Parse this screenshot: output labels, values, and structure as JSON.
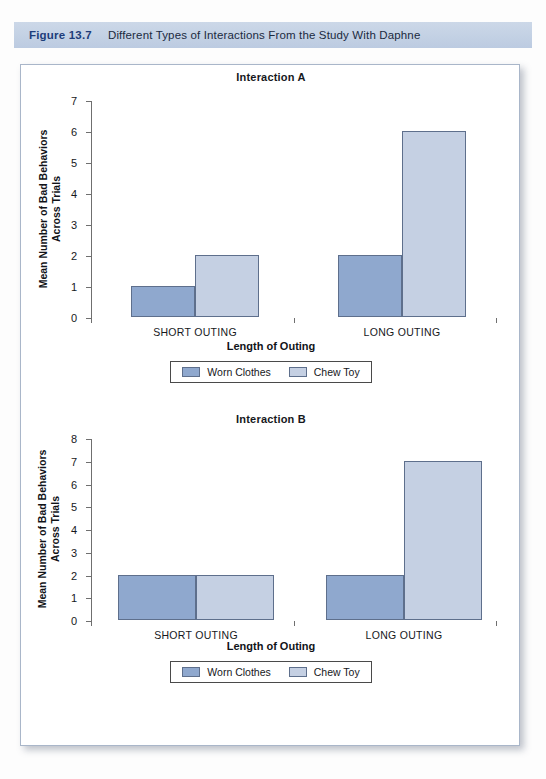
{
  "figure": {
    "number": "Figure 13.7",
    "title": "Different Types of Interactions From the Study With Daphne",
    "bar_color": "#c3d1e4",
    "number_color": "#1d3d7a"
  },
  "series_colors": {
    "worn_clothes": "#8fa8ce",
    "chew_toy": "#c5d0e3"
  },
  "legend": {
    "worn_clothes_label": "Worn Clothes",
    "chew_toy_label": "Chew Toy"
  },
  "chart_data": [
    {
      "id": "interaction-a",
      "type": "bar",
      "title": "Interaction A",
      "xlabel": "Length of Outing",
      "ylabel": "Mean Number of Bad Behaviors Across Trials",
      "ylabel_line1": "Mean Number of Bad Behaviors",
      "ylabel_line2": "Across Trials",
      "categories": [
        "SHORT OUTING",
        "LONG OUTING"
      ],
      "yticks": [
        0,
        1,
        2,
        3,
        4,
        5,
        6,
        7
      ],
      "ylim": [
        0,
        7
      ],
      "grid": false,
      "legend_position": "bottom",
      "series": [
        {
          "name": "Worn Clothes",
          "values": [
            1,
            2
          ],
          "color": "#8fa8ce"
        },
        {
          "name": "Chew Toy",
          "values": [
            2,
            6
          ],
          "color": "#c5d0e3"
        }
      ]
    },
    {
      "id": "interaction-b",
      "type": "bar",
      "title": "Interaction B",
      "xlabel": "Length of Outing",
      "ylabel": "Mean Number of Bad Behaviors Across Trials",
      "ylabel_line1": "Mean Number of Bad Behaviors",
      "ylabel_line2": "Across Trials",
      "categories": [
        "SHORT OUTING",
        "LONG OUTING"
      ],
      "yticks": [
        0,
        1,
        2,
        3,
        4,
        5,
        6,
        7,
        8
      ],
      "ylim": [
        0,
        8
      ],
      "grid": false,
      "legend_position": "bottom",
      "series": [
        {
          "name": "Worn Clothes",
          "values": [
            2,
            2
          ],
          "color": "#8fa8ce"
        },
        {
          "name": "Chew Toy",
          "values": [
            2,
            7
          ],
          "color": "#c5d0e3"
        }
      ]
    }
  ]
}
